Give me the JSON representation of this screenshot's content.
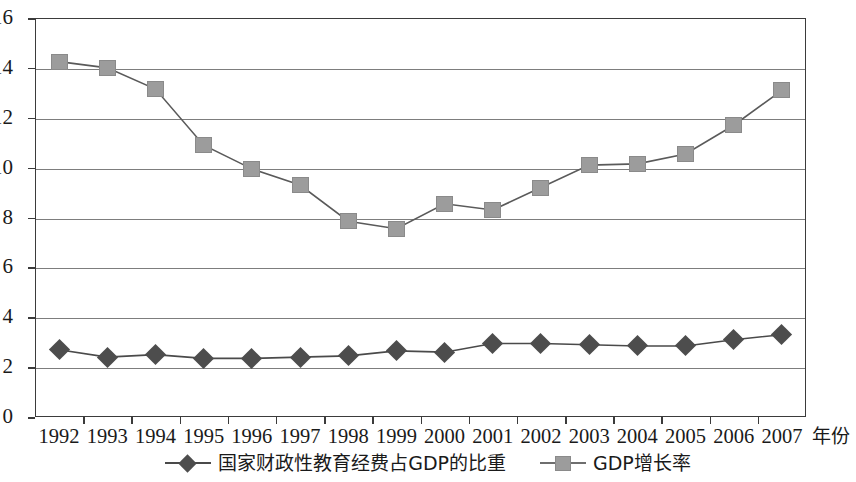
{
  "chart_data": {
    "type": "line",
    "title": "",
    "xlabel": "年份",
    "ylabel": "",
    "x": [
      "1992",
      "1993",
      "1994",
      "1995",
      "1996",
      "1997",
      "1998",
      "1999",
      "2000",
      "2001",
      "2002",
      "2003",
      "2004",
      "2005",
      "2006",
      "2007"
    ],
    "ylim": [
      0,
      16
    ],
    "yticks": [
      "0",
      "2",
      "4",
      "6",
      "8",
      "10",
      "12",
      "14",
      "16"
    ],
    "grid": "horizontal",
    "legend_position": "bottom",
    "series": [
      {
        "name": "国家财政性教育经费占GDP的比重",
        "marker": "diamond",
        "color": "#4d4d4d",
        "values": [
          2.7,
          2.4,
          2.5,
          2.35,
          2.35,
          2.4,
          2.45,
          2.65,
          2.6,
          2.95,
          2.95,
          2.9,
          2.85,
          2.85,
          3.1,
          3.3
        ]
      },
      {
        "name": "GDP增长率",
        "marker": "square",
        "color": "#9c9c9c",
        "values": [
          14.25,
          14.0,
          13.15,
          10.9,
          9.95,
          9.3,
          7.85,
          7.55,
          8.55,
          8.3,
          9.2,
          10.1,
          10.15,
          10.55,
          11.7,
          13.1
        ]
      }
    ]
  },
  "legend": {
    "entries": [
      {
        "label": "国家财政性教育经费占GDP的比重"
      },
      {
        "label": "GDP增长率"
      }
    ]
  },
  "axis": {
    "x_title": "年份"
  }
}
